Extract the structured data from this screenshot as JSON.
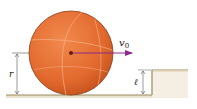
{
  "figure": {
    "type": "physics-diagram",
    "labels": {
      "velocity": "v",
      "velocity_subscript": "0",
      "radius": "r",
      "step_height": "ℓ"
    },
    "colors": {
      "ball_fill": "#e8743a",
      "ball_shade": "#c9561f",
      "ball_seams": "#f6b48a",
      "ball_outline": "#8a3a14",
      "velocity_arrow": "#8b2a8a",
      "center_dot": "#6b1a0a",
      "ground_fill": "#e9e2cf",
      "ground_line": "#9c8a5a",
      "dimension_line": "#555555"
    }
  }
}
